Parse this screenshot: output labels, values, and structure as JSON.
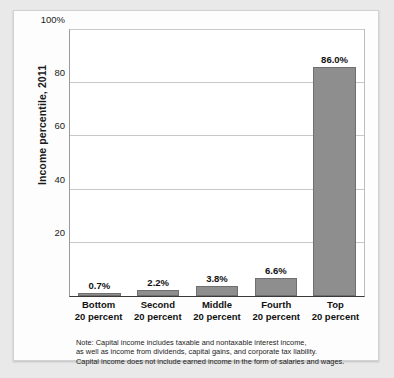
{
  "chart_data": {
    "type": "bar",
    "title": "",
    "xlabel": "",
    "ylabel": "Income percentile, 2011",
    "categories": [
      "Bottom 20 percent",
      "Second 20 percent",
      "Middle 20 percent",
      "Fourth 20 percent",
      "Top 20 percent"
    ],
    "category_lines": [
      [
        "Bottom",
        "20 percent"
      ],
      [
        "Second",
        "20 percent"
      ],
      [
        "Middle",
        "20 percent"
      ],
      [
        "Fourth",
        "20 percent"
      ],
      [
        "Top",
        "20 percent"
      ]
    ],
    "values": [
      0.7,
      2.2,
      3.8,
      6.6,
      86.0
    ],
    "data_labels": [
      "0.7%",
      "2.2%",
      "3.8%",
      "6.6%",
      "86.0%"
    ],
    "ylim": [
      0,
      100
    ],
    "yticks": [
      0,
      20,
      40,
      60,
      80,
      100
    ],
    "ytick_labels": [
      "",
      "20",
      "40",
      "60",
      "80",
      "100%"
    ],
    "grid": true,
    "legend": "none",
    "bar_color": "#8e8e8e",
    "bar_edge_color": "#6f6f6f",
    "note_lines": [
      "Note: Capital income includes taxable and nontaxable interest income,",
      "as well as income from dividends, capital gains, and corporate tax liability.",
      "Capital income does not include earned income in the form of salaries and wages."
    ]
  }
}
